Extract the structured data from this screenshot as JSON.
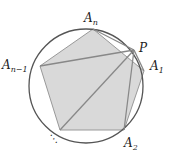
{
  "diagram": {
    "circle": {
      "cx": 86,
      "cy": 86,
      "r": 57,
      "stroke": "#555555"
    },
    "polygon_fill": "#d9d9d9",
    "polygon_stroke": "#999999",
    "line_color": "#888888",
    "vertices": {
      "An": {
        "x": 93,
        "y": 29
      },
      "A1": {
        "x": 144,
        "y": 71
      },
      "A2": {
        "x": 124,
        "y": 130
      },
      "Ak": {
        "x": 60,
        "y": 130
      },
      "An1": {
        "x": 40,
        "y": 66
      }
    },
    "point_P": {
      "x": 134,
      "y": 50
    },
    "labels": {
      "An": "A",
      "An_sub": "n",
      "An1": "A",
      "An1_sub": "n−1",
      "A1": "A",
      "A1_sub": "1",
      "A2": "A",
      "A2_sub": "2",
      "P": "P",
      "dots": "⋱"
    }
  }
}
